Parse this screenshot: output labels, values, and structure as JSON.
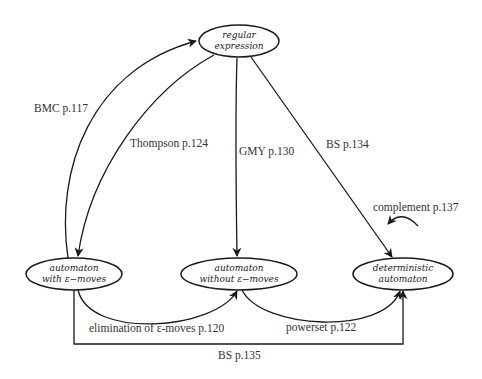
{
  "nodes": {
    "regex": {
      "line1": "regular",
      "line2": "expression"
    },
    "eps": {
      "line1": "automaton",
      "line2": "with ε−moves"
    },
    "noeps": {
      "line1": "automaton",
      "line2": "without ε−moves"
    },
    "det": {
      "line1": "deterministic",
      "line2": "automaton"
    }
  },
  "edges": {
    "bmc": "BMC p.117",
    "thompson": "Thompson p.124",
    "gmy": "GMY p.130",
    "bs134": "BS p.134",
    "complement": "complement p.137",
    "elimination": "elimination of ε-moves p.120",
    "powerset": "powerset p.122",
    "bs135": "BS p.135"
  },
  "colors": {
    "stroke": "#1a1a1a",
    "background": "#ffffff"
  }
}
